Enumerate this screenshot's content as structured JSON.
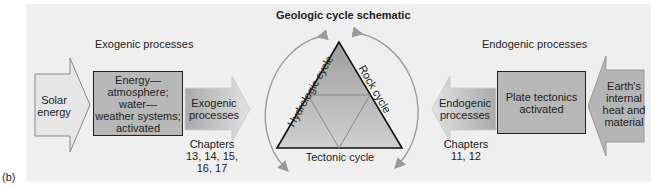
{
  "figure_label": "(b)",
  "title": "Geologic cycle schematic",
  "exogenic": {
    "heading": "Exogenic processes",
    "input_arrow": {
      "line1": "Solar",
      "line2": "energy"
    },
    "box": {
      "line1": "Energy—",
      "line2": "atmosphere;",
      "line3": "water—",
      "line4": "weather systems;",
      "line5": "activated"
    },
    "output_arrow": {
      "line1": "Exogenic",
      "line2": "processes"
    },
    "chapters": {
      "line1": "Chapters",
      "line2": "13, 14, 15,",
      "line3": "16, 17"
    }
  },
  "triangle": {
    "left_side": "Hydrologic cycle",
    "right_side": "Rock cycle",
    "bottom_side": "Tectonic cycle"
  },
  "endogenic": {
    "heading": "Endogenic processes",
    "input_arrow": {
      "line1": "Earth's",
      "line2": "internal",
      "line3": "heat and",
      "line4": "material"
    },
    "box": {
      "line1": "Plate tectonics",
      "line2": "activated"
    },
    "output_arrow": {
      "line1": "Endogenic",
      "line2": "processes"
    },
    "chapters": {
      "line1": "Chapters",
      "line2": "11, 12"
    }
  },
  "colors": {
    "panel": "#efefef",
    "box_fill": "#b7b7b7",
    "arrow_fill": "#dcdcdc",
    "outline": "#222222",
    "cycle_arrow": "#9a9a9a"
  }
}
